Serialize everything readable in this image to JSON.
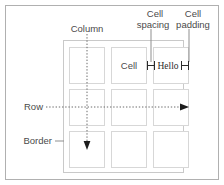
{
  "diagram": {
    "colors": {
      "outer_frame": "#b0b0b0",
      "table_frame": "#c9c9c9",
      "cell_border": "#d7d7d7",
      "label_text": "#4a4a4a",
      "cell_text": "#2b2b2b",
      "leader_line": "#8f8f8f",
      "guide_line": "#6b6b6b",
      "background": "#ffffff"
    },
    "labels": {
      "column": "Column",
      "row": "Row",
      "border": "Border",
      "cell": "Cell",
      "cell_spacing_line1": "Cell",
      "cell_spacing_line2": "spacing",
      "cell_padding_line1": "Cell",
      "cell_padding_line2": "padding"
    },
    "cells": {
      "content_text": "Hello",
      "rows": 3,
      "columns": 3
    },
    "annotations": [
      {
        "name": "column-guide",
        "style": "dotted",
        "direction": "down"
      },
      {
        "name": "row-guide",
        "style": "dotted",
        "direction": "right"
      },
      {
        "name": "border-leader",
        "style": "solid",
        "direction": "right"
      },
      {
        "name": "cell-spacing-leader",
        "style": "solid",
        "direction": "down"
      },
      {
        "name": "cell-padding-leader",
        "style": "solid",
        "direction": "down"
      }
    ]
  }
}
